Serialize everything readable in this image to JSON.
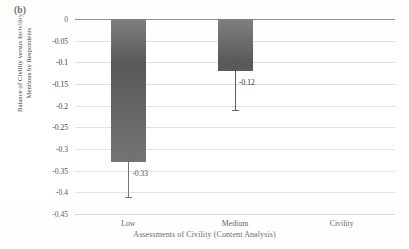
{
  "panel": {
    "label": "(b)"
  },
  "chart_data": {
    "type": "bar",
    "title": "",
    "panel_label": "(b)",
    "categories": [
      "Low",
      "Medium",
      "Civility"
    ],
    "values": [
      -0.33,
      -0.12,
      0
    ],
    "value_labels": [
      "-0.33",
      "-0.12",
      ""
    ],
    "error_bars": {
      "low": [
        -0.41,
        -0.21,
        0
      ],
      "high": [
        -0.25,
        -0.04,
        0
      ]
    },
    "xlabel": "Assessments of Civility (Content Analysis)",
    "ylabel": "Balance of Civility versus Incivility Mentions by Respondents",
    "ylabel_lines": [
      "Balance of Civility versus Incivility",
      "Mentions by Respondents"
    ],
    "ylim": [
      -0.45,
      0
    ],
    "ytick_labels": [
      "0",
      "-0.05",
      "-0.1",
      "-0.15",
      "-0.2",
      "-0.25",
      "-0.3",
      "-0.35",
      "-0.4",
      "-0.45"
    ],
    "ytick_values": [
      0,
      -0.05,
      -0.1,
      -0.15,
      -0.2,
      -0.25,
      -0.3,
      -0.35,
      -0.4,
      -0.45
    ],
    "grid": true,
    "legend": "none",
    "bar_color": "#595959",
    "gridline_color": "#dedede",
    "axis_color": "#6e6e6e"
  }
}
